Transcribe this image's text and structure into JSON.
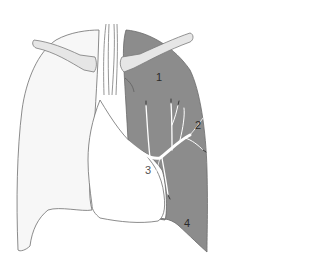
{
  "diagram": {
    "colors": {
      "background": "#ffffff",
      "right_lung_fill": "#f7f7f7",
      "left_lung_fill": "#8c8c8c",
      "outline": "#6e6e6e",
      "clavicle_fill": "#e6e6e6",
      "vessels": "#ffffff",
      "label_text": "#2a2a2a"
    },
    "labels": [
      {
        "id": "1",
        "text": "1",
        "x": 156,
        "y": 77
      },
      {
        "id": "2",
        "text": "2",
        "x": 195,
        "y": 124
      },
      {
        "id": "3",
        "text": "3",
        "x": 146,
        "y": 170
      },
      {
        "id": "4",
        "text": "4",
        "x": 184,
        "y": 223
      }
    ],
    "structures": [
      "right-lung",
      "left-lung",
      "trachea",
      "right-clavicle",
      "left-clavicle",
      "heart-cardiac-notch",
      "pulmonary-vessels"
    ]
  }
}
